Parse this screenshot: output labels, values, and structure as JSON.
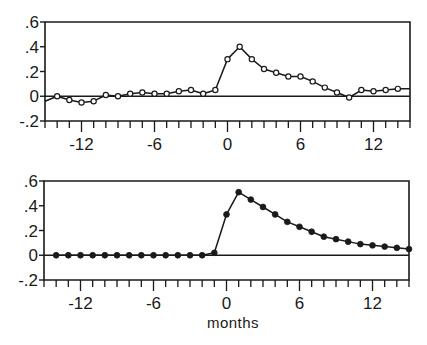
{
  "chart_data": [
    {
      "type": "line",
      "panel": "top",
      "marker": "open-circle",
      "title": "",
      "xlabel": "",
      "ylabel": "",
      "xlim": [
        -15,
        15
      ],
      "ylim": [
        -0.2,
        0.6
      ],
      "xticks": [
        -12,
        -6,
        0,
        6,
        12
      ],
      "xtick_labels": [
        "-12",
        "-6",
        "0",
        "6",
        "12"
      ],
      "xminor_step": 1,
      "yticks": [
        0.6,
        0.4,
        0.2,
        0,
        -0.2
      ],
      "ytick_labels": [
        ".6",
        ".4",
        ".2",
        "0",
        "-.2"
      ],
      "zero_line": true,
      "grid": false,
      "line_start": {
        "x": -15,
        "y": -0.04
      },
      "line_end": {
        "x": 15,
        "y": 0.06
      },
      "x": [
        -14,
        -13,
        -12,
        -11,
        -10,
        -9,
        -8,
        -7,
        -6,
        -5,
        -4,
        -3,
        -2,
        -1,
        0,
        1,
        2,
        3,
        4,
        5,
        6,
        7,
        8,
        9,
        10,
        11,
        12,
        13,
        14
      ],
      "values": [
        0.0,
        -0.03,
        -0.05,
        -0.04,
        0.01,
        0.0,
        0.02,
        0.03,
        0.02,
        0.02,
        0.04,
        0.05,
        0.02,
        0.05,
        0.3,
        0.4,
        0.3,
        0.22,
        0.19,
        0.16,
        0.16,
        0.12,
        0.07,
        0.03,
        -0.01,
        0.05,
        0.04,
        0.05,
        0.06
      ]
    },
    {
      "type": "line",
      "panel": "bottom",
      "marker": "filled-circle",
      "title": "",
      "xlabel": "months",
      "ylabel": "",
      "xlim": [
        -15,
        15
      ],
      "ylim": [
        -0.2,
        0.6
      ],
      "xticks": [
        -12,
        -6,
        0,
        6,
        12
      ],
      "xtick_labels": [
        "-12",
        "-6",
        "0",
        "6",
        "12"
      ],
      "xminor_step": 1,
      "yticks": [
        0.6,
        0.4,
        0.2,
        0,
        -0.2
      ],
      "ytick_labels": [
        ".6",
        ".4",
        ".2",
        "0",
        "-.2"
      ],
      "zero_line": true,
      "grid": false,
      "x": [
        -14,
        -13,
        -12,
        -11,
        -10,
        -9,
        -8,
        -7,
        -6,
        -5,
        -4,
        -3,
        -2,
        -1,
        0,
        1,
        2,
        3,
        4,
        5,
        6,
        7,
        8,
        9,
        10,
        11,
        12,
        13,
        14,
        15
      ],
      "values": [
        0,
        0,
        0,
        0,
        0,
        0,
        0,
        0,
        0,
        0,
        0,
        0,
        0,
        0.02,
        0.33,
        0.51,
        0.45,
        0.39,
        0.33,
        0.27,
        0.23,
        0.19,
        0.15,
        0.13,
        0.11,
        0.09,
        0.08,
        0.07,
        0.06,
        0.05
      ]
    }
  ],
  "figure": {
    "xlabel": "months",
    "colors": {
      "ink": "#1a1a1a",
      "background": "#ffffff"
    }
  }
}
